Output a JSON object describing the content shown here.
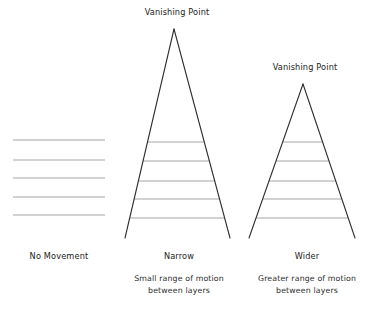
{
  "canvas": {
    "width": 370,
    "height": 312,
    "background": "#ffffff",
    "line_color_rung": "#a5a5a5",
    "line_color_leg": "#2f2f2f",
    "text_color": "#222222"
  },
  "panels": [
    {
      "id": "no-movement",
      "title": "",
      "label": "No Movement",
      "caption_line1": "",
      "caption_line2": "",
      "type": "parallel-lines",
      "label_x": 59,
      "label_y": 259,
      "lines": {
        "x_left": 13,
        "x_right": 105,
        "ys": [
          140,
          160,
          178,
          197,
          215
        ]
      }
    },
    {
      "id": "narrow",
      "title": "Vanishing Point",
      "title_x": 177,
      "title_y": 15,
      "label": "Narrow",
      "caption_line1": "Small range of motion",
      "caption_line2": "between layers",
      "type": "triangle",
      "label_x": 179,
      "label_y": 259,
      "caption_x": 179,
      "caption_y1": 281,
      "caption_y2": 293,
      "apex": {
        "x": 174,
        "y": 29
      },
      "base": {
        "x_left": 125,
        "x_right": 230,
        "y": 238
      },
      "rung_ys": [
        142,
        161,
        181,
        199,
        218
      ]
    },
    {
      "id": "wider",
      "title": "Vanishing Point",
      "title_x": 305,
      "title_y": 70,
      "label": "Wider",
      "caption_line1": "Greater range of motion",
      "caption_line2": "between layers",
      "type": "triangle",
      "label_x": 307,
      "label_y": 259,
      "caption_x": 307,
      "caption_y1": 281,
      "caption_y2": 293,
      "apex": {
        "x": 303,
        "y": 84
      },
      "base": {
        "x_left": 249,
        "x_right": 355,
        "y": 238
      },
      "rung_ys": [
        142,
        161,
        181,
        199,
        218
      ]
    }
  ]
}
